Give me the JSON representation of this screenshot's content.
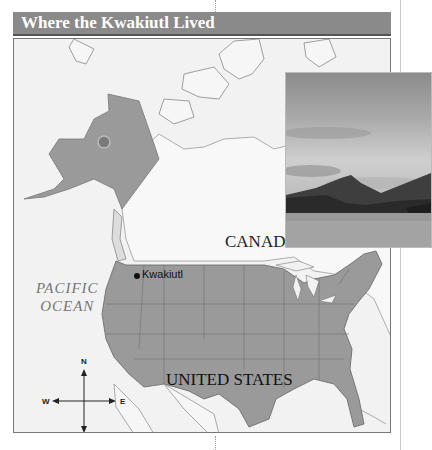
{
  "header": {
    "title": "Where the Kwakiutl Lived"
  },
  "map": {
    "labels": {
      "canada": "CANADA",
      "united_states": "UNITED STATES",
      "ocean_line1": "PACIFIC",
      "ocean_line2": "OCEAN"
    },
    "marker": {
      "label": "Kwakiutl"
    },
    "compass": {
      "north": "N",
      "south": "S",
      "east": "E",
      "west": "W"
    },
    "colors": {
      "land_highlight": "#9a9a9a",
      "land_other": "#f2f2f2",
      "water": "#f2f2f2",
      "header_bar": "#8a8a8a"
    }
  },
  "photo": {
    "subject": "coastal-mountains-landscape"
  }
}
